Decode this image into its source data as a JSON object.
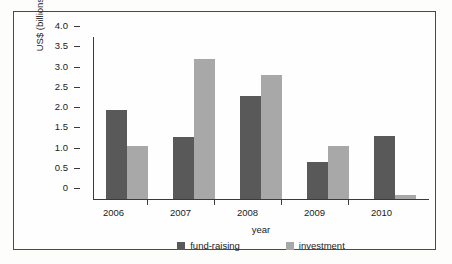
{
  "chart_data": {
    "type": "bar",
    "title": "",
    "subtitle": "",
    "xlabel": "year",
    "ylabel": "US$ (billions)",
    "categories": [
      "2006",
      "2007",
      "2008",
      "2009",
      "2010"
    ],
    "series": [
      {
        "name": "fund-raising",
        "color": "#595959",
        "values": [
          2.2,
          1.52,
          2.55,
          0.92,
          1.55
        ]
      },
      {
        "name": "investment",
        "color": "#a8a8a8",
        "values": [
          1.3,
          3.45,
          3.05,
          1.3,
          0.1
        ]
      }
    ],
    "ylim": [
      0,
      4.0
    ],
    "ytick_values": [
      0,
      0.5,
      1.0,
      1.5,
      2.0,
      2.5,
      3.0,
      3.5,
      4.0
    ],
    "ytick_labels": [
      "0",
      "0.5",
      "1.0",
      "1.5",
      "2.0",
      "2.5",
      "3.0",
      "3.5",
      "4.0"
    ],
    "grid": false,
    "legend_position": "bottom",
    "legend_entries": [
      "fund-raising",
      "investment"
    ],
    "annotations": []
  },
  "colors": {
    "axis": "#3a3a3a",
    "frame": "#4a4a4a",
    "background": "#fefefe",
    "text": "#1b1b1b",
    "series_dark": "#595959",
    "series_light": "#a8a8a8"
  }
}
